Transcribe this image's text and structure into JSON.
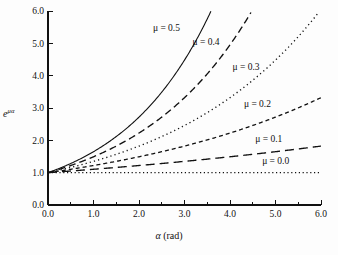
{
  "figure": {
    "kind": "line-chart",
    "background_color": "#fdfdfd",
    "ink_color": "#111111"
  },
  "axes": {
    "x_title_symbol": "α",
    "x_title_units": "(rad)",
    "y_title_base": "e",
    "y_title_exponent": "μα",
    "x_ticks": [
      "0.0",
      "1.0",
      "2.0",
      "3.0",
      "4.0",
      "5.0",
      "6.0"
    ],
    "y_ticks": [
      "0.0",
      "1.0",
      "2.0",
      "3.0",
      "4.0",
      "5.0",
      "6.0"
    ]
  },
  "curve_labels": {
    "mu05": "μ = 0.5",
    "mu04": "μ = 0.4",
    "mu03": "μ = 0.3",
    "mu02": "μ = 0.2",
    "mu01": "μ = 0.1",
    "mu00": "μ = 0.0"
  },
  "chart_data": {
    "type": "line",
    "title": "",
    "subtitle": "",
    "xlabel": "α (rad)",
    "ylabel": "e^{μα}",
    "xlim": [
      0.0,
      6.0
    ],
    "ylim": [
      0.0,
      6.0
    ],
    "xticks": [
      0.0,
      1.0,
      2.0,
      3.0,
      4.0,
      5.0,
      6.0
    ],
    "yticks": [
      0.0,
      1.0,
      2.0,
      3.0,
      4.0,
      5.0,
      6.0
    ],
    "grid": false,
    "legend_position": "inline-annotations",
    "x": [
      0.0,
      0.5,
      1.0,
      1.5,
      2.0,
      2.5,
      3.0,
      3.5,
      4.0,
      4.5,
      5.0,
      5.5,
      6.0
    ],
    "series": [
      {
        "name": "μ = 0.5",
        "mu": 0.5,
        "linestyle": "solid",
        "values": [
          1.0,
          1.28,
          1.65,
          2.12,
          2.72,
          3.49,
          4.48,
          5.75,
          7.39,
          9.49,
          12.18,
          15.64,
          20.09
        ],
        "visible_until_x": 3.58,
        "annotation": {
          "text": "μ = 0.5",
          "x": 2.35,
          "y": 5.45
        }
      },
      {
        "name": "μ = 0.4",
        "mu": 0.4,
        "linestyle": "long-dash",
        "values": [
          1.0,
          1.22,
          1.49,
          1.82,
          2.23,
          2.72,
          3.32,
          4.06,
          4.95,
          6.05,
          7.39,
          9.03,
          11.02
        ],
        "visible_until_x": 4.48,
        "annotation": {
          "text": "μ = 0.4",
          "x": 3.22,
          "y": 5.0
        }
      },
      {
        "name": "μ = 0.3",
        "mu": 0.3,
        "linestyle": "dotted",
        "values": [
          1.0,
          1.16,
          1.35,
          1.57,
          1.82,
          2.12,
          2.46,
          2.86,
          3.32,
          3.86,
          4.48,
          5.21,
          6.05
        ],
        "visible_until_x": 5.97,
        "annotation": {
          "text": "μ = 0.3",
          "x": 4.1,
          "y": 4.25
        }
      },
      {
        "name": "μ = 0.2",
        "mu": 0.2,
        "linestyle": "short-dash",
        "values": [
          1.0,
          1.11,
          1.22,
          1.35,
          1.49,
          1.65,
          1.82,
          2.01,
          2.23,
          2.46,
          2.72,
          3.0,
          3.32
        ],
        "visible_until_x": 6.0,
        "annotation": {
          "text": "μ = 0.2",
          "x": 4.35,
          "y": 3.1
        }
      },
      {
        "name": "μ = 0.1",
        "mu": 0.1,
        "linestyle": "long-dash",
        "values": [
          1.0,
          1.05,
          1.11,
          1.16,
          1.22,
          1.28,
          1.35,
          1.42,
          1.49,
          1.57,
          1.65,
          1.73,
          1.82
        ],
        "visible_until_x": 6.0,
        "annotation": {
          "text": "μ = 0.1",
          "x": 4.6,
          "y": 2.0
        }
      },
      {
        "name": "μ = 0.0",
        "mu": 0.0,
        "linestyle": "dotted",
        "values": [
          1.0,
          1.0,
          1.0,
          1.0,
          1.0,
          1.0,
          1.0,
          1.0,
          1.0,
          1.0,
          1.0,
          1.0,
          1.0
        ],
        "visible_until_x": 6.0,
        "annotation": {
          "text": "μ = 0.0",
          "x": 4.75,
          "y": 1.32
        }
      }
    ]
  }
}
